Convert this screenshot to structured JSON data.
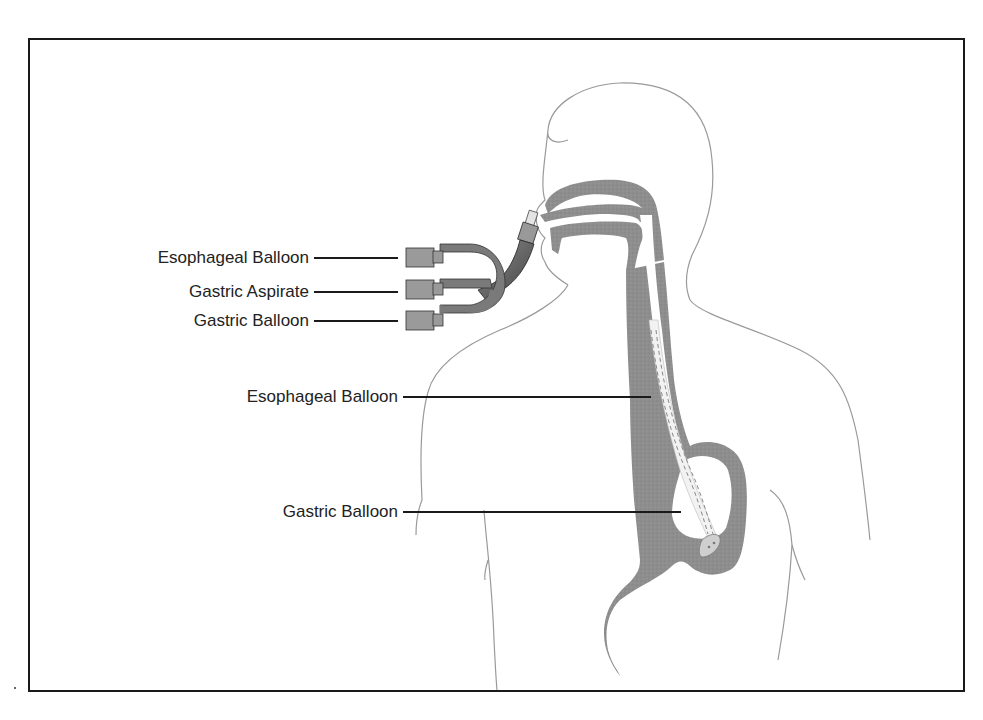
{
  "diagram": {
    "title": "",
    "type": "anatomical-illustration",
    "colors": {
      "frame": "#1a1a1a",
      "body_outline": "#9a9a9a",
      "tissue": "#8c8c8c",
      "tube": "#555555",
      "connector": "#999999",
      "leader_line": "#1a1a1a"
    },
    "labels": {
      "left_connectors": [
        {
          "id": "esophageal-balloon-port",
          "text": "Esophageal Balloon"
        },
        {
          "id": "gastric-aspirate-port",
          "text": "Gastric Aspirate"
        },
        {
          "id": "gastric-balloon-port",
          "text": "Gastric Balloon"
        }
      ],
      "in_body": [
        {
          "id": "esophageal-balloon",
          "text": "Esophageal Balloon"
        },
        {
          "id": "gastric-balloon",
          "text": "Gastric Balloon"
        }
      ]
    }
  }
}
